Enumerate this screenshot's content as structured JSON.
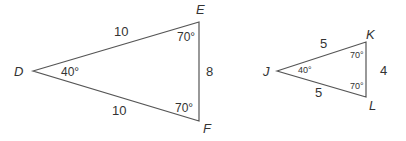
{
  "diagram": {
    "type": "similar-triangles",
    "triangles": [
      {
        "name": "DEF",
        "vertices": {
          "D": {
            "label": "D",
            "x": 33,
            "y": 71
          },
          "E": {
            "label": "E",
            "x": 199,
            "y": 22
          },
          "F": {
            "label": "F",
            "x": 199,
            "y": 121
          }
        },
        "sides": {
          "DE": "10",
          "DF": "10",
          "EF": "8"
        },
        "angles": {
          "D": "40°",
          "E": "70°",
          "F": "70°"
        }
      },
      {
        "name": "JKL",
        "vertices": {
          "J": {
            "label": "J",
            "x": 277,
            "y": 71
          },
          "K": {
            "label": "K",
            "x": 366,
            "y": 42
          },
          "L": {
            "label": "L",
            "x": 366,
            "y": 97
          }
        },
        "sides": {
          "JK": "5",
          "JL": "5",
          "KL": "4"
        },
        "angles": {
          "J": "40°",
          "K": "70°",
          "L": "70°"
        }
      }
    ],
    "colors": {
      "stroke": "#555555",
      "text": "#333333",
      "background": "#ffffff"
    }
  }
}
